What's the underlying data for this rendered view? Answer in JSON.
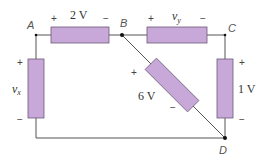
{
  "diagram": {
    "type": "circuit",
    "colors": {
      "element_fill": "#c8a8d8",
      "element_stroke": "#6b5a78",
      "wire": "#555555",
      "node_dot": "#111111"
    },
    "nodes": [
      {
        "id": "A",
        "label": "A"
      },
      {
        "id": "B",
        "label": "B"
      },
      {
        "id": "C",
        "label": "C"
      },
      {
        "id": "D",
        "label": "D"
      }
    ],
    "elements": [
      {
        "id": "e_ab",
        "from": "A",
        "to": "B",
        "label": "2 V",
        "plus": "+",
        "minus": "−"
      },
      {
        "id": "e_bc",
        "from": "B",
        "to": "C",
        "label_var": "v",
        "label_sub": "y",
        "plus": "+",
        "minus": "−"
      },
      {
        "id": "e_ad",
        "from": "A",
        "to": "D",
        "label_var": "v",
        "label_sub": "x",
        "plus": "+",
        "minus": "−"
      },
      {
        "id": "e_bd",
        "from": "B",
        "to": "D",
        "label": "6 V",
        "plus": "+",
        "minus": "−"
      },
      {
        "id": "e_cd",
        "from": "C",
        "to": "D",
        "label": "1 V",
        "plus": "+",
        "minus": "−"
      }
    ]
  }
}
